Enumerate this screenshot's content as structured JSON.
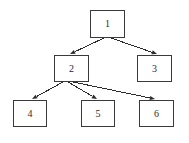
{
  "diagram": {
    "type": "directed-tree",
    "canvas": {
      "width": 189,
      "height": 143,
      "background": "#ffffff"
    },
    "style": {
      "node_fill": "#ffffff",
      "node_stroke": "#3a3a3a",
      "edge_stroke": "#2b2b2b",
      "label_color": "#2b2b2b"
    },
    "nodes": [
      {
        "id": "1",
        "label": "1",
        "x": 90,
        "y": 10,
        "w": 35,
        "h": 28
      },
      {
        "id": "2",
        "label": "2",
        "x": 54,
        "y": 55,
        "w": 35,
        "h": 27
      },
      {
        "id": "3",
        "label": "3",
        "x": 137,
        "y": 55,
        "w": 35,
        "h": 27
      },
      {
        "id": "4",
        "label": "4",
        "x": 13,
        "y": 100,
        "w": 34,
        "h": 27
      },
      {
        "id": "5",
        "label": "5",
        "x": 81,
        "y": 100,
        "w": 34,
        "h": 27
      },
      {
        "id": "6",
        "label": "6",
        "x": 139,
        "y": 100,
        "w": 35,
        "h": 27
      }
    ],
    "edges": [
      {
        "from": "1",
        "to": "2",
        "x1": 104,
        "y1": 38,
        "x2": 70,
        "y2": 54
      },
      {
        "from": "1",
        "to": "3",
        "x1": 111,
        "y1": 38,
        "x2": 157,
        "y2": 54
      },
      {
        "from": "2",
        "to": "4",
        "x1": 63,
        "y1": 82,
        "x2": 32,
        "y2": 99
      },
      {
        "from": "2",
        "to": "5",
        "x1": 68,
        "y1": 82,
        "x2": 97,
        "y2": 99
      },
      {
        "from": "2",
        "to": "6",
        "x1": 73,
        "y1": 82,
        "x2": 155,
        "y2": 99
      }
    ]
  }
}
